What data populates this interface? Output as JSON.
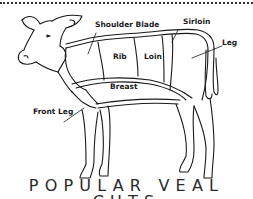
{
  "diagram": {
    "title": "POPULAR VEAL CUTS",
    "cuts": [
      {
        "id": "shoulder-blade",
        "label": "Shoulder Blade"
      },
      {
        "id": "sirloin",
        "label": "Sirloin"
      },
      {
        "id": "leg",
        "label": "Leg"
      },
      {
        "id": "rib",
        "label": "Rib"
      },
      {
        "id": "loin",
        "label": "Loin"
      },
      {
        "id": "breast",
        "label": "Breast"
      },
      {
        "id": "front-leg",
        "label": "Front Leg"
      }
    ],
    "colors": {
      "line": "#1a1a1a",
      "background": "#ffffff",
      "title": "#2a2a2a"
    }
  }
}
